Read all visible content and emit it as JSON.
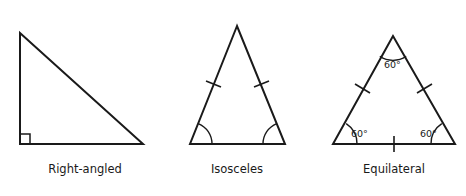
{
  "figure": {
    "background_color": "#ffffff",
    "line_color": "#1a1a1a",
    "width": 466,
    "height": 196
  },
  "triangles": [
    {
      "id": "right-angled",
      "caption": "Right-angled",
      "caption_x": 85,
      "caption_y": 173,
      "vertices": [
        {
          "name": "apex",
          "x": 20,
          "y": 33
        },
        {
          "name": "right-angle-corner",
          "x": 20,
          "y": 144
        },
        {
          "name": "base-right",
          "x": 143,
          "y": 144
        }
      ],
      "markers": {
        "right_angle_square": {
          "x": 20,
          "y": 144,
          "size": 10
        },
        "side_ticks": [],
        "angle_arcs": [],
        "angle_labels": []
      }
    },
    {
      "id": "isosceles",
      "caption": "Isosceles",
      "caption_x": 237,
      "caption_y": 173,
      "vertices": [
        {
          "name": "apex",
          "x": 237,
          "y": 26
        },
        {
          "name": "base-left",
          "x": 190,
          "y": 144
        },
        {
          "name": "base-right",
          "x": 285,
          "y": 144
        }
      ],
      "markers": {
        "side_ticks": [
          {
            "side": "left-leg",
            "t": 0.5
          },
          {
            "side": "right-leg",
            "t": 0.5
          }
        ],
        "angle_arcs": [
          {
            "vertex": "base-left",
            "radius": 22
          },
          {
            "vertex": "base-right",
            "radius": 22
          }
        ],
        "angle_labels": []
      }
    },
    {
      "id": "equilateral",
      "caption": "Equilateral",
      "caption_x": 394,
      "caption_y": 173,
      "vertices": [
        {
          "name": "apex",
          "x": 393,
          "y": 36
        },
        {
          "name": "base-left",
          "x": 333,
          "y": 144
        },
        {
          "name": "base-right",
          "x": 455,
          "y": 144
        }
      ],
      "markers": {
        "side_ticks": [
          {
            "side": "left-leg",
            "t": 0.5
          },
          {
            "side": "right-leg",
            "t": 0.5
          },
          {
            "side": "base",
            "t": 0.5
          }
        ],
        "angle_arcs": [
          {
            "vertex": "apex",
            "radius": 24
          },
          {
            "vertex": "base-left",
            "radius": 24
          },
          {
            "vertex": "base-right",
            "radius": 24
          }
        ],
        "angle_labels": [
          {
            "vertex": "apex",
            "text": "60°",
            "x": 384,
            "y": 68
          },
          {
            "vertex": "base-left",
            "text": "60°",
            "x": 351,
            "y": 137
          },
          {
            "vertex": "base-right",
            "text": "60°",
            "x": 420,
            "y": 137
          }
        ]
      }
    }
  ]
}
